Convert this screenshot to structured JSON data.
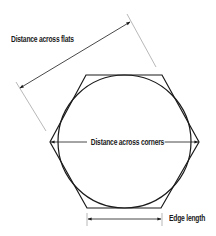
{
  "diagram": {
    "type": "hexagon-dimension-diagram",
    "labels": {
      "flats": "Distance across flats",
      "corners": "Distance across corners",
      "edge": "Edge length"
    },
    "shapes": {
      "hexagon": {
        "vertices": [
          [
            86,
            75
          ],
          [
            162,
            75
          ],
          [
            199,
            142
          ],
          [
            161,
            208
          ],
          [
            87,
            208
          ],
          [
            50,
            142
          ]
        ],
        "stroke": "#1a1a1a"
      },
      "inscribed_circle": {
        "cx": 124.5,
        "cy": 141.5,
        "r": 66.5,
        "stroke": "#1a1a1a"
      }
    },
    "dimensions": {
      "flats": {
        "extension_lines": [
          [
            [
              127,
              14
            ],
            [
              156,
              67
            ]
          ],
          [
            [
              16,
              82
            ],
            [
              46,
              131
            ]
          ]
        ],
        "arrow": [
          [
            20,
            88
          ],
          [
            130,
            22
          ]
        ]
      },
      "corners": {
        "arrow": [
          [
            50,
            142
          ],
          [
            199,
            142
          ]
        ]
      },
      "edge": {
        "extension_lines": [
          [
            [
              87,
              213
            ],
            [
              87,
              226
            ]
          ],
          [
            [
              162,
              213
            ],
            [
              162,
              226
            ]
          ]
        ],
        "arrow": [
          [
            87,
            219
          ],
          [
            162,
            219
          ]
        ]
      }
    },
    "colors": {
      "line": "#1a1a1a",
      "extension": "#9a9a9a",
      "background": "#ffffff"
    }
  }
}
